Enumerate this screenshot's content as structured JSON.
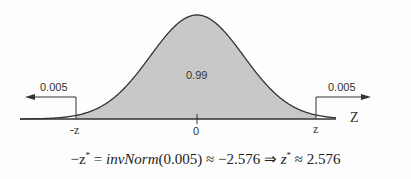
{
  "diagram": {
    "type": "normal-distribution-two-tailed",
    "center_area_label": "0.99",
    "left_tail_label": "0.005",
    "right_tail_label": "0.005",
    "axis_label": "Z",
    "tick_labels": {
      "left": "-z",
      "center": "0",
      "right": "z"
    },
    "fill_color": "#c8c8c8",
    "curve_color": "#333333"
  },
  "formula": {
    "lhs": "−z",
    "star": "*",
    "eq": " = ",
    "func": "invNorm",
    "arg": "(0.005)",
    "approx1": " ≈ −2.576 ⇒ ",
    "z": "z",
    "approx2": " ≈ 2.576"
  }
}
